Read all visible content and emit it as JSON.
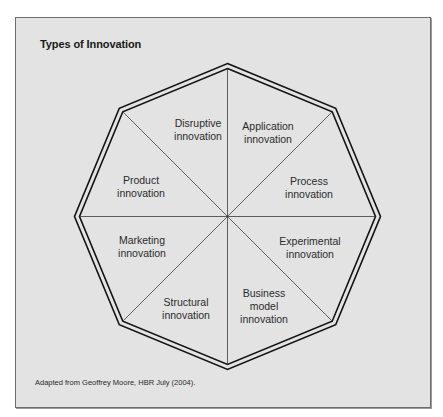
{
  "diagram": {
    "title": "Types of Innovation",
    "caption": "Adapted from Geoffrey Moore, HBR July (2004).",
    "shape": "octagon",
    "colors": {
      "background": "#ffffff",
      "panel": "#e3e3e3",
      "panel_border": "#6d6d6d",
      "lines": "#1a1a1a",
      "text": "#2b2b2b"
    },
    "segments": [
      {
        "id": "disruptive",
        "line1": "Disruptive",
        "line2": "innovation",
        "line3": ""
      },
      {
        "id": "application",
        "line1": "Application",
        "line2": "innovation",
        "line3": ""
      },
      {
        "id": "process",
        "line1": "Process",
        "line2": "innovation",
        "line3": ""
      },
      {
        "id": "experimental",
        "line1": "Experimental",
        "line2": "innovation",
        "line3": ""
      },
      {
        "id": "business-model",
        "line1": "Business",
        "line2": "model",
        "line3": "innovation"
      },
      {
        "id": "structural",
        "line1": "Structural",
        "line2": "innovation",
        "line3": ""
      },
      {
        "id": "marketing",
        "line1": "Marketing",
        "line2": "innovation",
        "line3": ""
      },
      {
        "id": "product",
        "line1": "Product",
        "line2": "innovation",
        "line3": ""
      }
    ]
  }
}
